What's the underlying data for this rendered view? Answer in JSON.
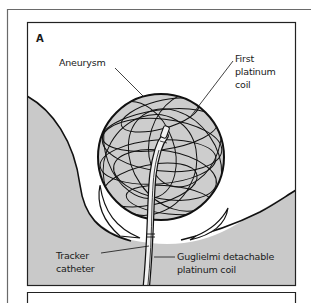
{
  "figure": {
    "panel_letter": "A",
    "colors": {
      "tissue_fill": "#c9c9c9",
      "sphere_fill": "#cdcdcd",
      "outline": "#111111",
      "frame": "#555555",
      "background": "#ffffff"
    },
    "labels": {
      "aneurysm": "Aneurysm",
      "first_coil_line1": "First",
      "first_coil_line2": "platinum",
      "first_coil_line3": "coil",
      "tracker_line1": "Tracker",
      "tracker_line2": "catheter",
      "gdc_line1": "Guglielmi detachable",
      "gdc_line2": "platinum coil"
    }
  }
}
